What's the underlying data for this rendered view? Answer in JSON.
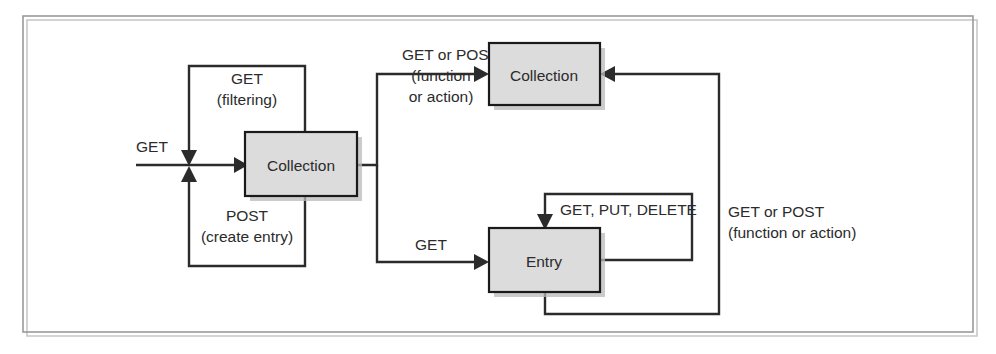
{
  "diagram": {
    "colors": {
      "node_fill": "#dcdcdc",
      "stroke": "#2b2b2b",
      "frame": "#9a9a9a",
      "background": "#ffffff"
    },
    "nodes": [
      {
        "id": "collection-left",
        "label": "Collection"
      },
      {
        "id": "collection-top",
        "label": "Collection"
      },
      {
        "id": "entry",
        "label": "Entry"
      }
    ],
    "edges": [
      {
        "id": "input-get",
        "label": "GET",
        "from": "external",
        "to": "collection-left"
      },
      {
        "id": "collection-filtering-loop",
        "label_line1": "GET",
        "label_line2": "(filtering)",
        "from": "collection-left",
        "to": "collection-left"
      },
      {
        "id": "collection-create-loop",
        "label_line1": "POST",
        "label_line2": "(create entry)",
        "from": "collection-left",
        "to": "collection-left"
      },
      {
        "id": "collection-to-collection-top",
        "label_line1": "GET or POST",
        "label_line2": "(function",
        "label_line3": "or action)",
        "from": "collection-left",
        "to": "collection-top"
      },
      {
        "id": "collection-to-entry",
        "label": "GET",
        "from": "collection-left",
        "to": "entry"
      },
      {
        "id": "entry-self-loop",
        "label": "GET, PUT, DELETE",
        "from": "entry",
        "to": "entry"
      },
      {
        "id": "entry-to-collection-top",
        "label_line1": "GET or POST",
        "label_line2": "(function or action)",
        "from": "entry",
        "to": "collection-top"
      }
    ]
  }
}
